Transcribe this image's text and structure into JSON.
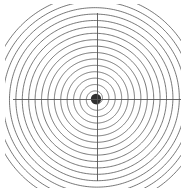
{
  "figure": {
    "title": "",
    "background_color": "#ffffff",
    "width": 186,
    "height": 193
  },
  "chart_data": {
    "type": "line",
    "title": "",
    "subtitle": "",
    "xlabel": "",
    "ylabel": "",
    "plot_kind": "polar-archimedean-spiral",
    "grid": false,
    "legend": null,
    "legend_position": "none",
    "center": {
      "x": 96,
      "y": 99
    },
    "axes": {
      "horizontal_line": {
        "x_start": 13,
        "x_end": 181,
        "y": 99
      },
      "vertical_line": {
        "y_start": 13,
        "y_end": 181,
        "x": 97
      },
      "axis_color": "#555555",
      "axis_width": 0.9
    },
    "spiral": {
      "equation": "r = a * theta",
      "a": 1.02,
      "theta_start": 0,
      "theta_end": 106.8,
      "theta_step": 0.02,
      "turns": 17,
      "rotation_deg": 0,
      "direction": "counterclockwise",
      "line_color": "#4a4a4a",
      "line_width": 0.75,
      "r_max": 109,
      "clip_to_plot_box": true,
      "plot_box": {
        "x0": 5,
        "y0": 4,
        "x1": 181,
        "y1": 188
      }
    },
    "center_blob": {
      "radius": 5.2,
      "color": "#303030",
      "description": "dense overlapping spiral windings near origin"
    },
    "x": [],
    "values": [],
    "xlim": [
      -91,
      85
    ],
    "ylim": [
      -95,
      89
    ]
  }
}
